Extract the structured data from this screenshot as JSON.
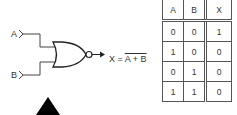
{
  "diagram": {
    "type": "NOR gate",
    "inputs": [
      "A",
      "B"
    ],
    "output_label": "X =",
    "output_expression": "A + B",
    "output_expression_overlined": true
  },
  "truth_table": {
    "headers": [
      "A",
      "B",
      "X"
    ],
    "rows": [
      [
        "0",
        "0",
        "1"
      ],
      [
        "1",
        "0",
        "0"
      ],
      [
        "0",
        "1",
        "0"
      ],
      [
        "1",
        "1",
        "0"
      ]
    ]
  }
}
